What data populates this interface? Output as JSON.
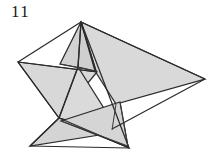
{
  "figure": {
    "label": "11",
    "caption_number": "11",
    "background_color": "#ffffff",
    "fill_color": "#d6d6d6",
    "fill_color_light": "#dedede",
    "fill_color_dark": "#c8c8c8",
    "stroke_color": "#2b2b2b",
    "label_color": "#1a1a1a",
    "width": 217,
    "height": 161
  },
  "geometry": {
    "vertices": {
      "apex_top": [
        81,
        22
      ],
      "right_tip": [
        205,
        79
      ],
      "left_tip": [
        18,
        62
      ],
      "bottom_left_tip": [
        30,
        146
      ],
      "bottom_tip": [
        129,
        148
      ],
      "center_upper": [
        78,
        68
      ],
      "center_lower": [
        60,
        117
      ],
      "mid_right": [
        122,
        101
      ],
      "mid_left": [
        96,
        71
      ]
    },
    "faces": [
      {
        "name": "large-right-triangle",
        "points": "81,22 205,79 118,103",
        "fill": "#d9d9d9"
      },
      {
        "name": "upper-left-triangle",
        "points": "81,22 96,71 61,64",
        "fill": "#d2d2d2"
      },
      {
        "name": "left-wing-triangle",
        "points": "18,62 96,72 60,117",
        "fill": "#d8d8d8"
      },
      {
        "name": "lower-left-triangle",
        "points": "60,117 30,146 108,126",
        "fill": "#d4d4d4"
      },
      {
        "name": "lower-center-triangle",
        "points": "78,68 129,148 60,117",
        "fill": "#dadada"
      },
      {
        "name": "bottom-sliver",
        "points": "60,120 128,146 122,101",
        "fill": "#d5d5d5"
      }
    ],
    "edges": [
      {
        "name": "apex-to-left-tip",
        "path": "M 81,22 L 18,62"
      },
      {
        "name": "apex-to-right-tip",
        "path": "M 81,22 L 205,79"
      },
      {
        "name": "apex-to-center",
        "path": "M 81,22 L 78,68"
      },
      {
        "name": "apex-to-bottom",
        "path": "M 81,22 L 129,148"
      },
      {
        "name": "left-tip-to-center-lower",
        "path": "M 18,62 L 60,117"
      },
      {
        "name": "right-tip-to-mid",
        "path": "M 205,79 L 108,126"
      },
      {
        "name": "center-lower-to-bottom-left",
        "path": "M 60,117 L 30,146"
      },
      {
        "name": "bottom-left-to-bottom",
        "path": "M 30,146 L 129,148"
      },
      {
        "name": "center-upper-to-center-lower",
        "path": "M 78,68 L 60,117"
      },
      {
        "name": "cross-edge-left",
        "path": "M 61,64 L 96,71"
      },
      {
        "name": "cross-edge-long",
        "path": "M 60,120 L 128,146"
      }
    ]
  }
}
